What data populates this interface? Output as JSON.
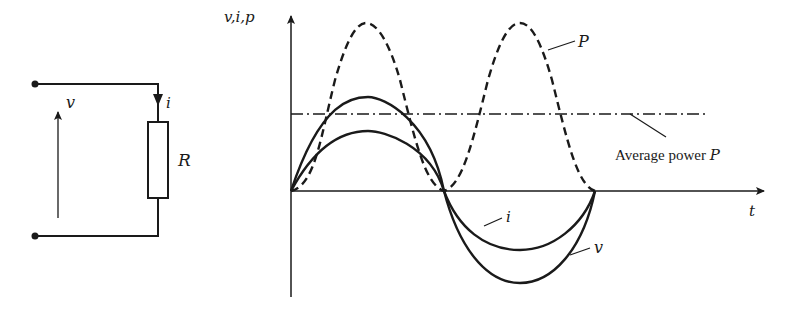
{
  "circuit": {
    "voltage_label": "v",
    "current_label": "i",
    "resistor_label": "R"
  },
  "graph": {
    "y_axis_label": "v,i,p",
    "x_axis_label": "t",
    "power_curve_label": "P",
    "average_power_label": "Average power ",
    "average_power_symbol": "P",
    "current_curve_label": "i",
    "voltage_curve_label": "v"
  },
  "colors": {
    "ink": "#1a1a1a",
    "background": "#ffffff"
  }
}
